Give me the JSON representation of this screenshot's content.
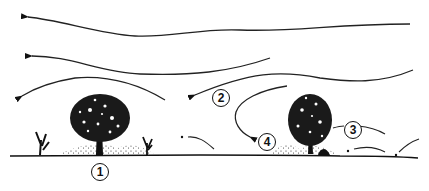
{
  "diagram": {
    "colors": {
      "ink": "#111111",
      "background": "#ffffff"
    },
    "labels": [
      {
        "id": "1",
        "text": "1",
        "x": 91,
        "y": 163
      },
      {
        "id": "2",
        "text": "2",
        "x": 212,
        "y": 89
      },
      {
        "id": "3",
        "text": "3",
        "x": 344,
        "y": 121
      },
      {
        "id": "4",
        "text": "4",
        "x": 258,
        "y": 133
      }
    ],
    "elements": {
      "wind_arrows": 5,
      "shrubs": 2,
      "grass_tufts": 2,
      "ground_line": true
    }
  }
}
